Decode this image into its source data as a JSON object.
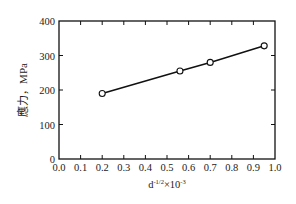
{
  "chart_data": {
    "type": "line",
    "title": "",
    "xlabel": "d^-1/2 ×10^-3",
    "xlabel_parts": {
      "base": "d",
      "exp1": "-1/2",
      "mid": "×10",
      "exp2": "-3"
    },
    "ylabel": "應力，MPa",
    "xlim": [
      0.0,
      1.0
    ],
    "ylim": [
      0,
      400
    ],
    "xticks": [
      "0.0",
      "0.1",
      "0.2",
      "0.3",
      "0.4",
      "0.5",
      "0.6",
      "0.7",
      "0.8",
      "0.9",
      "1.0"
    ],
    "yticks": [
      "0",
      "100",
      "200",
      "300",
      "400"
    ],
    "grid": false,
    "legend": null,
    "series": [
      {
        "name": "stress",
        "marker": "open-circle",
        "line": "solid",
        "color": "#111111",
        "x": [
          0.2,
          0.56,
          0.7,
          0.95
        ],
        "y": [
          190,
          255,
          280,
          328
        ]
      }
    ]
  }
}
